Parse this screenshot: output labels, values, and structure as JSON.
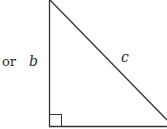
{
  "diagram": {
    "type": "right-triangle",
    "prefix_text": "or",
    "labels": {
      "vertical_leg": "b",
      "hypotenuse": "c"
    },
    "right_angle_marker": "bottom-left",
    "stroke_color": "#333333",
    "background": "#ffffff"
  }
}
